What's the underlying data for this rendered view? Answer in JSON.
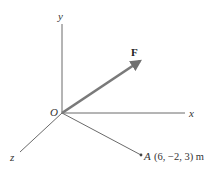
{
  "diagram": {
    "type": "3d-vector-coordinate-system",
    "axes": {
      "x_label": "x",
      "y_label": "y",
      "z_label": "z"
    },
    "origin_label": "O",
    "force": {
      "label": "F",
      "color": "#7a7a7a"
    },
    "point": {
      "label": "A",
      "coordinates": "(6, −2, 3) m",
      "x": 6,
      "y": -2,
      "z": 3,
      "unit": "m"
    },
    "colors": {
      "axis": "#666666",
      "background": "#ffffff"
    }
  }
}
